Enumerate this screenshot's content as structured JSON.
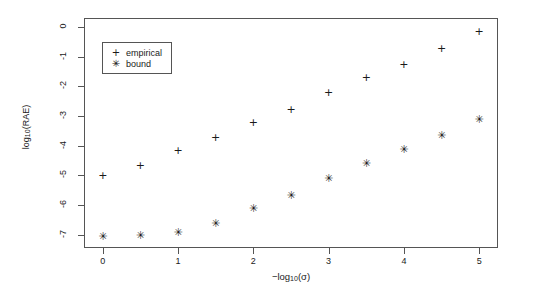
{
  "chart_data": {
    "type": "scatter",
    "title": "",
    "xlabel": "-log10(sigma)",
    "ylabel": "log10(RAE)",
    "xlabel_parts": {
      "prefix": "−log",
      "sub": "10",
      "suffix": "(σ)"
    },
    "ylabel_parts": {
      "prefix": "log",
      "sub": "10",
      "suffix": "(RAE)"
    },
    "x": [
      0,
      0.5,
      1,
      1.5,
      2,
      2.5,
      3,
      3.5,
      4,
      4.5,
      5
    ],
    "series": [
      {
        "name": "empirical",
        "marker": "+",
        "marker_name": "plus-marker",
        "values": [
          -5.0,
          -4.65,
          -4.15,
          -3.7,
          -3.2,
          -2.75,
          -2.2,
          -1.7,
          -1.25,
          -0.7,
          -0.15
        ]
      },
      {
        "name": "bound",
        "marker": "✳",
        "marker_name": "asterisk-marker",
        "values": [
          -7.05,
          -7.0,
          -6.9,
          -6.6,
          -6.1,
          -5.65,
          -5.1,
          -4.6,
          -4.1,
          -3.65,
          -3.1
        ]
      }
    ],
    "xlim": [
      -0.25,
      5.25
    ],
    "ylim": [
      -7.45,
      0.3
    ],
    "xticks": [
      0,
      1,
      2,
      3,
      4,
      5
    ],
    "xticklabels": [
      "0",
      "1",
      "2",
      "3",
      "4",
      "5"
    ],
    "yticks": [
      0,
      -1,
      -2,
      -3,
      -4,
      -5,
      -6,
      -7
    ],
    "yticklabels": [
      "0",
      "-1",
      "-2",
      "-3",
      "-4",
      "-5",
      "-6",
      "-7"
    ],
    "grid": false,
    "legend": {
      "position": "upper-left-inside",
      "entries": [
        {
          "glyph": "+",
          "label": "empirical"
        },
        {
          "glyph": "✳",
          "label": "bound"
        }
      ]
    },
    "colors": {
      "marker": "#1a1a1a",
      "axis": "#555555",
      "background": "#ffffff",
      "text": "#1a1a1a"
    }
  }
}
